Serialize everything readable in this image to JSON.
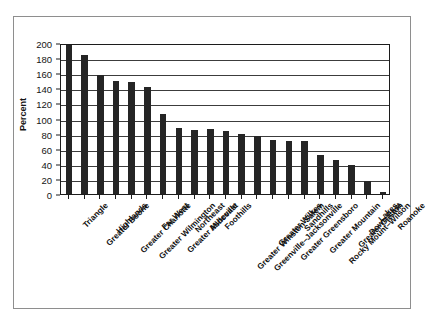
{
  "figure": {
    "background_color": "#ffffff",
    "frame_color": "#8e8e8e",
    "axis_color": "#1c1c1c",
    "bar_color": "#252525",
    "gridline_color": "#3c3c3c"
  },
  "chart_data": {
    "type": "bar",
    "title": "",
    "subtitle": "",
    "xlabel": "",
    "ylabel": "Percent",
    "ylim": [
      0,
      200
    ],
    "ytick_values": [
      0,
      20,
      40,
      60,
      80,
      100,
      120,
      140,
      160,
      180,
      200
    ],
    "ytick_labels": [
      "0",
      "20",
      "40",
      "60",
      "80",
      "100",
      "120",
      "140",
      "160",
      "180",
      "200"
    ],
    "grid": true,
    "grid_axis": "y",
    "legend": false,
    "legend_position": "none",
    "annotations": [],
    "categories": [
      "Triangle",
      "Greater Boone",
      "Highlands",
      "Greater Charlotte",
      "Greater Wilmington",
      "Far West",
      "Greater Asheville",
      "Northeast",
      "Midcoast",
      "Foothills",
      "Greater Winston-Salem",
      "Greenville–Jacksonville",
      "Greater Wilkes",
      "Greater Greensboro",
      "Sandhills",
      "Greater Mountain",
      "Rocky Mount–Wilson",
      "Greater Gaston",
      "Down East",
      "Lakes",
      "Roanoke"
    ],
    "values": [
      198,
      184,
      157,
      150,
      149,
      142,
      106,
      87,
      85,
      86,
      83,
      79,
      77,
      71,
      70,
      70,
      52,
      45,
      39,
      17,
      3
    ]
  }
}
